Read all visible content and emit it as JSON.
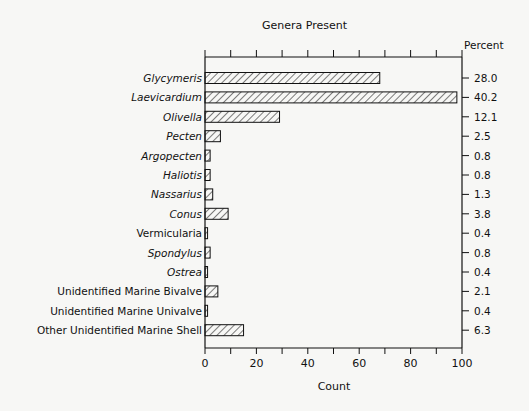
{
  "chart_data": {
    "type": "bar",
    "orientation": "horizontal",
    "title": "Genera Present",
    "xlabel": "Count",
    "ylabel": "",
    "secondary_axis_label": "Percent",
    "xlim": [
      0,
      100
    ],
    "x_ticks": [
      "0",
      "20",
      "40",
      "60",
      "80",
      "100"
    ],
    "grid": false,
    "legend": null,
    "categories": [
      "Glycymeris",
      "Laevicardium",
      "Olivella",
      "Pecten",
      "Argopecten",
      "Haliotis",
      "Nassarius",
      "Conus",
      "Vermicularia",
      "Spondylus",
      "Ostrea",
      "Unidentified Marine Bivalve",
      "Unidentified Marine Univalve",
      "Other Unidentified Marine Shell"
    ],
    "italic": [
      true,
      true,
      true,
      true,
      true,
      true,
      true,
      true,
      false,
      true,
      true,
      false,
      false,
      false
    ],
    "values": [
      68,
      98,
      29,
      6,
      2,
      2,
      3,
      9,
      1,
      2,
      1,
      5,
      1,
      15
    ],
    "percent": [
      "28.0",
      "40.2",
      "12.1",
      "2.5",
      "0.8",
      "0.8",
      "1.3",
      "3.8",
      "0.4",
      "0.8",
      "0.4",
      "2.1",
      "0.4",
      "6.3"
    ],
    "bar_fill": "diagonal hatch",
    "colors": {
      "ink": "#111111",
      "background": "#f7f7f5"
    }
  }
}
